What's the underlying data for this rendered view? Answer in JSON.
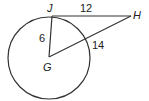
{
  "diagram": {
    "type": "geometry-circle-tangent",
    "stroke_color": "#333333",
    "background": "#ffffff",
    "circle": {
      "center_label": "G",
      "cx": 49,
      "cy": 58,
      "r": 42
    },
    "points": {
      "J": {
        "label": "J",
        "x": 52,
        "y": 16
      },
      "H": {
        "label": "H",
        "x": 131,
        "y": 16
      },
      "G": {
        "label": "G",
        "x": 49,
        "y": 57
      }
    },
    "segments": [
      {
        "from": "J",
        "to": "H",
        "length_label": "12"
      },
      {
        "from": "J",
        "to": "G",
        "length_label": "6"
      },
      {
        "from": "G",
        "to": "H",
        "length_label": "14"
      }
    ],
    "labels": {
      "J": "J",
      "H": "H",
      "G": "G",
      "JH": "12",
      "JG": "6",
      "GH": "14"
    }
  }
}
